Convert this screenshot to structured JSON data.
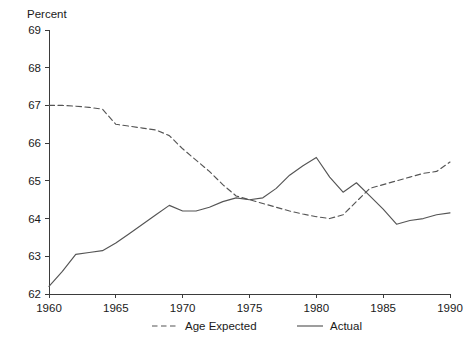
{
  "chart_data": {
    "type": "line",
    "title": "",
    "ylabel": "Percent",
    "xlabel": "",
    "xlim": [
      1960,
      1990
    ],
    "ylim": [
      62,
      69
    ],
    "grid": false,
    "legend_position": "bottom-center",
    "y_ticks": [
      62,
      63,
      64,
      65,
      66,
      67,
      68,
      69
    ],
    "x_ticks": [
      1960,
      1965,
      1970,
      1975,
      1980,
      1985,
      1990
    ],
    "y_tick_labels": [
      "62",
      "63",
      "64",
      "65",
      "66",
      "67",
      "68",
      "69"
    ],
    "x_tick_labels": [
      "1960",
      "1965",
      "1970",
      "1975",
      "1980",
      "1985",
      "1990"
    ],
    "x": [
      1960,
      1961,
      1962,
      1963,
      1964,
      1965,
      1966,
      1967,
      1968,
      1969,
      1970,
      1971,
      1972,
      1973,
      1974,
      1975,
      1976,
      1977,
      1978,
      1979,
      1980,
      1981,
      1982,
      1983,
      1984,
      1985,
      1986,
      1987,
      1988,
      1989,
      1990
    ],
    "series": [
      {
        "name": "Age Expected",
        "style": "dashed",
        "color": "#555555",
        "values": [
          67.0,
          67.0,
          66.98,
          66.95,
          66.9,
          66.5,
          66.45,
          66.4,
          66.35,
          66.2,
          65.85,
          65.55,
          65.25,
          64.9,
          64.6,
          64.5,
          64.4,
          64.3,
          64.2,
          64.12,
          64.05,
          64.0,
          64.1,
          64.45,
          64.8,
          64.9,
          65.0,
          65.1,
          65.2,
          65.25,
          65.5
        ]
      },
      {
        "name": "Actual",
        "style": "solid",
        "color": "#555555",
        "values": [
          62.2,
          62.6,
          63.05,
          63.1,
          63.15,
          63.35,
          63.6,
          63.85,
          64.1,
          64.35,
          64.2,
          64.2,
          64.3,
          64.45,
          64.55,
          64.5,
          64.55,
          64.8,
          65.15,
          65.4,
          65.62,
          65.1,
          64.7,
          64.95,
          64.6,
          64.25,
          63.85,
          63.95,
          64.0,
          64.1,
          64.15
        ]
      }
    ],
    "legend_entries": [
      {
        "label": "Age Expected",
        "style": "dashed"
      },
      {
        "label": "Actual",
        "style": "solid"
      }
    ]
  },
  "colors": {
    "line": "#555555",
    "axis": "#3b3b3b",
    "text": "#1a1a1a",
    "background": "#ffffff"
  }
}
